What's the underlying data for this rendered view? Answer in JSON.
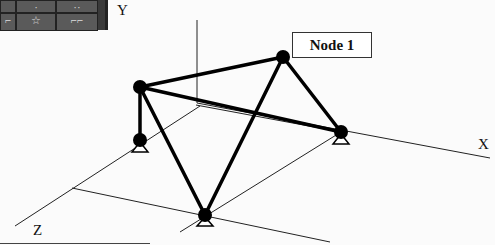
{
  "toolbar": {
    "icons": [
      "unknown-icon",
      "unknown-icon",
      "unknown-icon",
      "frame-icon",
      "star-icon",
      "tool-icon"
    ],
    "glyphs": [
      "",
      "·",
      "··",
      "⌐",
      "☆",
      "⌐⌐"
    ]
  },
  "axes": {
    "x_label": "X",
    "y_label": "Y",
    "z_label": "Z"
  },
  "callout": {
    "label": "Node 1"
  },
  "structure": {
    "nodes": [
      {
        "id": "top-left",
        "x": 140,
        "y": 87,
        "support": false
      },
      {
        "id": "bottom-left",
        "x": 140,
        "y": 140,
        "support": true
      },
      {
        "id": "node-1",
        "x": 283,
        "y": 57,
        "support": false
      },
      {
        "id": "right",
        "x": 341,
        "y": 132,
        "support": true
      },
      {
        "id": "bottom",
        "x": 205,
        "y": 215,
        "support": true
      }
    ],
    "members": [
      [
        "top-left",
        "bottom-left"
      ],
      [
        "top-left",
        "node-1"
      ],
      [
        "top-left",
        "right"
      ],
      [
        "top-left",
        "bottom"
      ],
      [
        "node-1",
        "right"
      ],
      [
        "node-1",
        "bottom"
      ]
    ]
  }
}
